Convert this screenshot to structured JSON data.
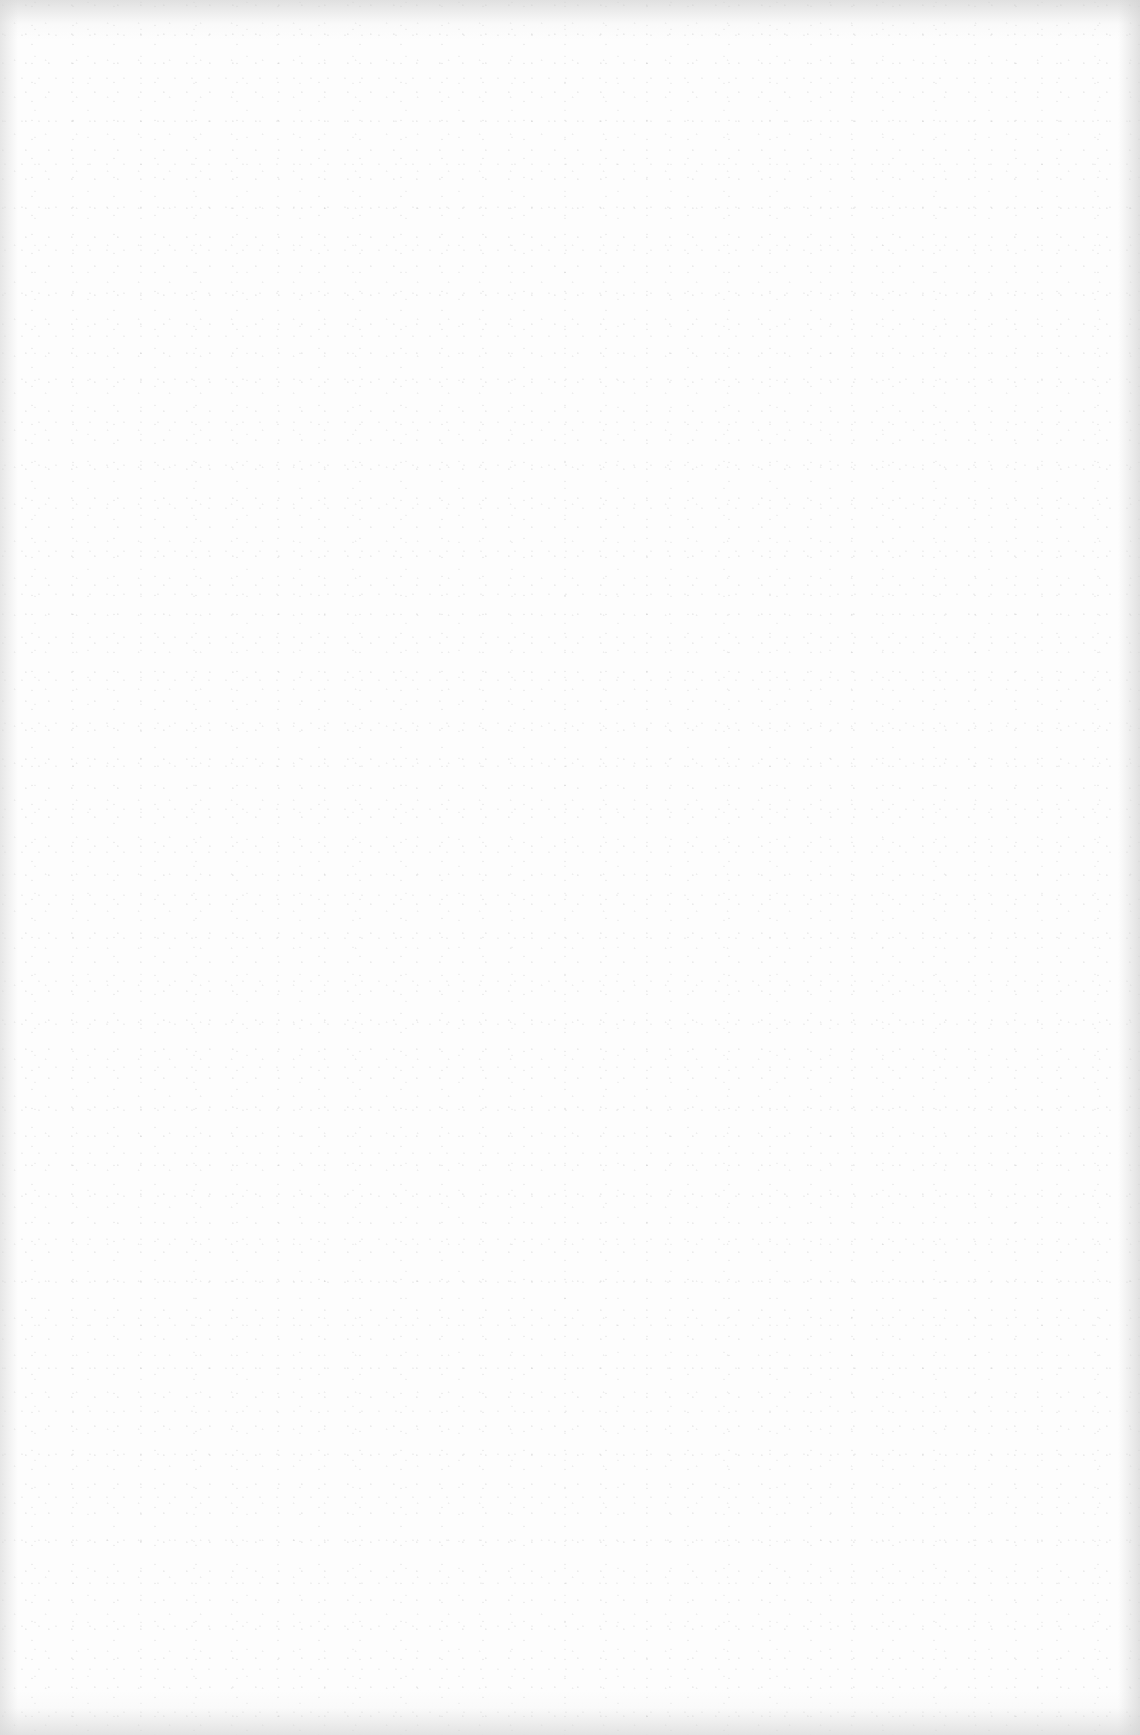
{
  "page": {
    "type": "blank-scanned-page",
    "background_color": "#fdfdfd",
    "edge_color": "#d2d2d2",
    "text_blocks": []
  }
}
